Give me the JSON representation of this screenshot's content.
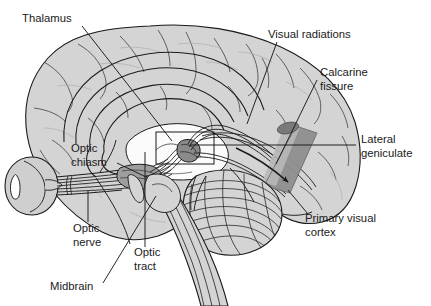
{
  "figure": {
    "type": "anatomical-diagram",
    "background_color": "#ffffff",
    "line_color": "#1a1a1a",
    "cortex_fill": "#d4d4d4",
    "ventricle_fill": "#fbfbfb",
    "eye_fill": "#cfcfcf",
    "radiation_fill_light": "#b8b8b8",
    "radiation_fill_dark": "#8e8e8e",
    "lgn_dot_fill": "#8a8a8a"
  },
  "labels": [
    {
      "id": "thalamus",
      "text": "Thalamus",
      "x": 22,
      "y": 22,
      "anchor": "start",
      "leader": {
        "x1": 82,
        "y1": 26,
        "x2": 172,
        "y2": 141
      }
    },
    {
      "id": "visual-radiations",
      "text": "Visual radiations",
      "x": 268,
      "y": 38,
      "anchor": "start",
      "leader": {
        "x1": 277,
        "y1": 42,
        "x2": 247,
        "y2": 124
      }
    },
    {
      "id": "calcarine-fissure",
      "text": "Calcarine",
      "text2": "fissure",
      "x": 320,
      "y": 76,
      "x2": 320,
      "y2": 90,
      "anchor": "start",
      "leader": {
        "x1": 317,
        "y1": 80,
        "x2": 276,
        "y2": 164
      }
    },
    {
      "id": "lateral-geniculate",
      "text": "Lateral",
      "text2": "geniculate",
      "x": 361,
      "y": 143,
      "x2": 361,
      "y2": 157,
      "anchor": "start",
      "leader": {
        "x1": 356,
        "y1": 145,
        "x2": 190,
        "y2": 145
      }
    },
    {
      "id": "primary-visual-cortex",
      "text": "Primary visual",
      "text2": "cortex",
      "x": 305,
      "y": 222,
      "x2": 305,
      "y2": 236,
      "anchor": "start",
      "leader": {
        "x1": 308,
        "y1": 214,
        "x2": 288,
        "y2": 190
      }
    },
    {
      "id": "optic-chiasm",
      "text": "Optic",
      "text2": "chiasm",
      "x": 71,
      "y": 152,
      "x2": 71,
      "y2": 166,
      "anchor": "start",
      "leader": {
        "x1": 117,
        "y1": 163,
        "x2": 146,
        "y2": 177
      }
    },
    {
      "id": "optic-nerve",
      "text": "Optic",
      "text2": "nerve",
      "x": 73,
      "y": 232,
      "x2": 73,
      "y2": 246,
      "anchor": "start",
      "leader": {
        "x1": 88,
        "y1": 222,
        "x2": 88,
        "y2": 191
      }
    },
    {
      "id": "optic-tract",
      "text": "Optic",
      "text2": "tract",
      "x": 134,
      "y": 256,
      "x2": 134,
      "y2": 270,
      "anchor": "start",
      "leader": {
        "x1": 145,
        "y1": 247,
        "x2": 145,
        "y2": 152
      }
    },
    {
      "id": "midbrain",
      "text": "Midbrain",
      "x": 50,
      "y": 290,
      "anchor": "start",
      "leader": {
        "x1": 103,
        "y1": 283,
        "x2": 156,
        "y2": 196
      }
    }
  ],
  "structures": [
    {
      "id": "cerebral-cortex",
      "name": "cerebral cortex"
    },
    {
      "id": "corpus-callosum",
      "name": "corpus callosum"
    },
    {
      "id": "cingulate-gyrus",
      "name": "cingulate gyrus"
    },
    {
      "id": "lateral-ventricle",
      "name": "lateral ventricle"
    },
    {
      "id": "eyeball",
      "name": "eyeball"
    },
    {
      "id": "lens",
      "name": "lens"
    },
    {
      "id": "optic-nerve-fibers",
      "name": "optic nerve fiber bundle"
    },
    {
      "id": "optic-chiasm-body",
      "name": "optic chiasm"
    },
    {
      "id": "optic-tract-fibers",
      "name": "optic tract fibers"
    },
    {
      "id": "lateral-geniculate-nucleus",
      "name": "lateral geniculate nucleus"
    },
    {
      "id": "lgn-callout-box",
      "name": "lateral geniculate callout box"
    },
    {
      "id": "optic-radiation-band",
      "name": "optic radiation band"
    },
    {
      "id": "calcarine-wedge",
      "name": "calcarine / primary visual cortex wedge"
    },
    {
      "id": "cerebellum",
      "name": "cerebellum"
    },
    {
      "id": "brainstem",
      "name": "brainstem"
    },
    {
      "id": "midbrain-body",
      "name": "midbrain"
    },
    {
      "id": "pathway-arrow",
      "name": "visual pathway direction arrow"
    }
  ]
}
